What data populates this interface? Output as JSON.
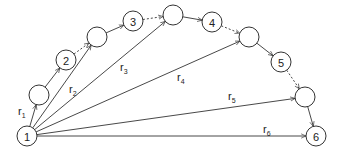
{
  "diagram": {
    "title": "",
    "nodes": [
      {
        "id": "n1",
        "label": "1",
        "x": 27,
        "y": 136
      },
      {
        "id": "a",
        "label": "",
        "x": 39,
        "y": 95
      },
      {
        "id": "n2",
        "label": "2",
        "x": 66,
        "y": 60
      },
      {
        "id": "b",
        "label": "",
        "x": 97,
        "y": 37
      },
      {
        "id": "n3",
        "label": "3",
        "x": 133,
        "y": 21
      },
      {
        "id": "c",
        "label": "",
        "x": 173,
        "y": 15
      },
      {
        "id": "n4",
        "label": "4",
        "x": 212,
        "y": 22
      },
      {
        "id": "d",
        "label": "",
        "x": 249,
        "y": 37
      },
      {
        "id": "n5",
        "label": "5",
        "x": 281,
        "y": 62
      },
      {
        "id": "e",
        "label": "",
        "x": 305,
        "y": 97
      },
      {
        "id": "n6",
        "label": "6",
        "x": 316,
        "y": 136
      }
    ],
    "node_radius": 10,
    "edges": [
      {
        "from": "n1",
        "to": "a",
        "style": "solid",
        "label": "r",
        "sub": "1"
      },
      {
        "from": "a",
        "to": "n2",
        "style": "solid"
      },
      {
        "from": "n2",
        "to": "b",
        "style": "dotted"
      },
      {
        "from": "b",
        "to": "n3",
        "style": "solid"
      },
      {
        "from": "n3",
        "to": "c",
        "style": "dotted"
      },
      {
        "from": "c",
        "to": "n4",
        "style": "solid"
      },
      {
        "from": "n4",
        "to": "d",
        "style": "dotted"
      },
      {
        "from": "d",
        "to": "n5",
        "style": "solid"
      },
      {
        "from": "n5",
        "to": "e",
        "style": "dotted"
      },
      {
        "from": "e",
        "to": "n6",
        "style": "solid"
      },
      {
        "from": "n1",
        "to": "b",
        "style": "solid",
        "label": "r",
        "sub": "2"
      },
      {
        "from": "n1",
        "to": "c",
        "style": "solid",
        "label": "r",
        "sub": "3"
      },
      {
        "from": "n1",
        "to": "d",
        "style": "solid",
        "label": "r",
        "sub": "4"
      },
      {
        "from": "n1",
        "to": "e",
        "style": "solid",
        "label": "r",
        "sub": "5"
      },
      {
        "from": "n1",
        "to": "n6",
        "style": "solid",
        "label": "r",
        "sub": "6"
      }
    ],
    "radius_labels": [
      {
        "main": "r",
        "sub": "1",
        "x": 18,
        "y": 115
      },
      {
        "main": "r",
        "sub": "2",
        "x": 69,
        "y": 93
      },
      {
        "main": "r",
        "sub": "3",
        "x": 120,
        "y": 71
      },
      {
        "main": "r",
        "sub": "4",
        "x": 177,
        "y": 81
      },
      {
        "main": "r",
        "sub": "5",
        "x": 228,
        "y": 100
      },
      {
        "main": "r",
        "sub": "6",
        "x": 263,
        "y": 133
      }
    ],
    "colors": {
      "stroke": "#333333",
      "text": "#222222",
      "background": "#ffffff"
    }
  }
}
